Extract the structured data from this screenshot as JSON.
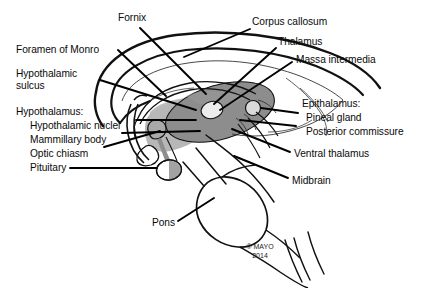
{
  "figure": {
    "copyright_line1": "© MAYO",
    "copyright_line2": "2014",
    "background_color": "#ffffff",
    "ink_color": "#000000",
    "thalamus_fill": "#8d8d8d",
    "hypothalamus_fill": "#b9b9b9",
    "massa_intermedia_fill": "#e8e8e8",
    "pineal_fill": "#d6d6d6",
    "pituitary_fill": "#ffffff"
  },
  "labels": {
    "fornix": "Fornix",
    "corpus_callosum": "Corpus callosum",
    "thalamus": "Thalamus",
    "massa_intermedia": "Massa intermedia",
    "foramen_of_monro": "Foramen of Monro",
    "hypothalamic_sulcus_1": "Hypothalamic",
    "hypothalamic_sulcus_2": "sulcus",
    "hypothalamus_heading": "Hypothalamus:",
    "hypothalamic_nuclei": "Hypothalamic nuclei",
    "mammillary_body": "Mammillary body",
    "optic_chiasm": "Optic chiasm",
    "pituitary": "Pituitary",
    "epithalamus_heading": "Epithalamus:",
    "pineal_gland": "Pineal gland",
    "posterior_commissure": "Posterior commissure",
    "ventral_thalamus": "Ventral thalamus",
    "midbrain": "Midbrain",
    "pons": "Pons"
  },
  "structures": [
    {
      "name": "corpus-callosum",
      "label": "Corpus callosum",
      "shading": "outline"
    },
    {
      "name": "fornix",
      "label": "Fornix",
      "shading": "outline"
    },
    {
      "name": "thalamus",
      "label": "Thalamus",
      "shading": "dark-gray"
    },
    {
      "name": "massa-intermedia",
      "label": "Massa intermedia",
      "shading": "light-gray"
    },
    {
      "name": "hypothalamus",
      "label": "Hypothalamus",
      "shading": "mid-gray"
    },
    {
      "name": "mammillary-body",
      "label": "Mammillary body",
      "shading": "mid-gray"
    },
    {
      "name": "optic-chiasm",
      "label": "Optic chiasm",
      "shading": "outline"
    },
    {
      "name": "pituitary",
      "label": "Pituitary",
      "shading": "white"
    },
    {
      "name": "pineal-gland",
      "label": "Pineal gland",
      "shading": "light-gray"
    },
    {
      "name": "posterior-commissure",
      "label": "Posterior commissure",
      "shading": "outline"
    },
    {
      "name": "ventral-thalamus",
      "label": "Ventral thalamus",
      "shading": "outline"
    },
    {
      "name": "midbrain",
      "label": "Midbrain",
      "shading": "outline"
    },
    {
      "name": "pons",
      "label": "Pons",
      "shading": "outline"
    },
    {
      "name": "foramen-of-monro",
      "label": "Foramen of Monro",
      "shading": "outline"
    },
    {
      "name": "hypothalamic-sulcus",
      "label": "Hypothalamic sulcus",
      "shading": "outline"
    }
  ]
}
